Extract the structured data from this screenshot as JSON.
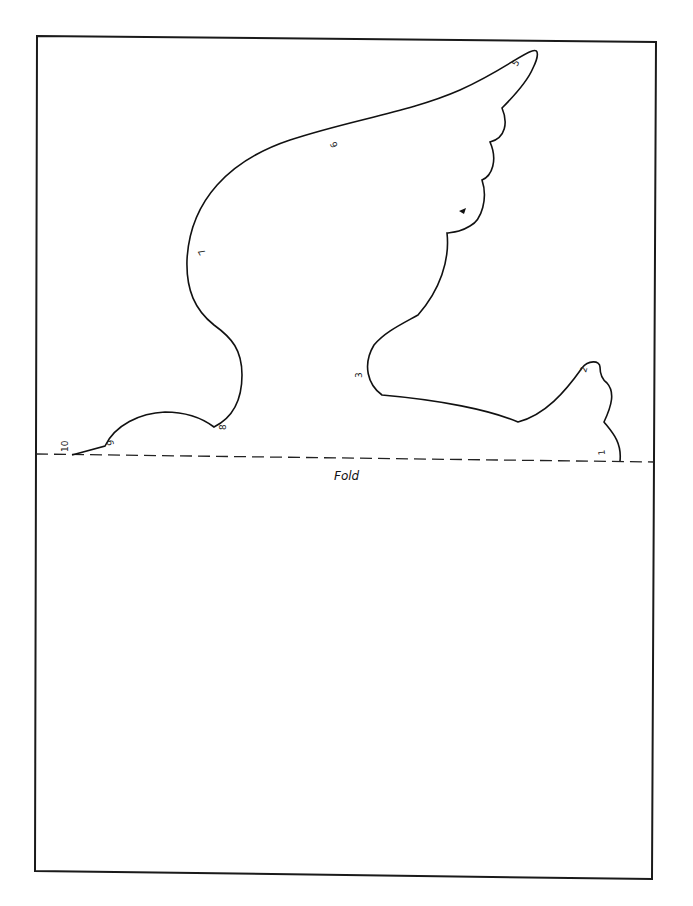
{
  "template": {
    "subject": "dove / bird cut-out pattern",
    "fold_label": "Fold",
    "point_labels": [
      "1",
      "2",
      "3",
      "4",
      "5",
      "6",
      "7",
      "8",
      "9",
      "10"
    ],
    "line_color": "#111111",
    "paper_color": "#ffffff"
  }
}
